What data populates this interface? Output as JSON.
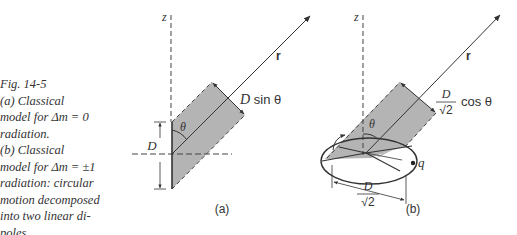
{
  "caption": {
    "lines": [
      "Fig. 14-5",
      "(a) Classical",
      "model for Δm = 0",
      "radiation.",
      "(b) Classical",
      "model for Δm = ±1",
      "radiation: circular",
      "motion decomposed",
      "into two linear di-",
      "poles."
    ]
  },
  "figure_a": {
    "panel_label": "(a)",
    "axis_label": "z",
    "vector_label": "r",
    "angle_label": "θ",
    "dipole_length_label": "D",
    "projection_label_D": "D",
    "projection_label_rest": " sin θ"
  },
  "figure_b": {
    "panel_label": "(b)",
    "axis_label": "z",
    "vector_label": "r",
    "angle_label": "θ",
    "charge_label": "q",
    "projection_num": "D",
    "projection_den": "√2",
    "projection_rest": "cos θ",
    "diameter_num": "D",
    "diameter_den": "√2"
  },
  "colors": {
    "shading": "#b4b4b4",
    "line": "#333333",
    "text": "#333333"
  }
}
